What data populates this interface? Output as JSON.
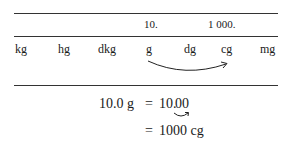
{
  "table": {
    "header_values": [
      {
        "unit": "g",
        "value": "10."
      },
      {
        "unit": "cg",
        "value": "1 000."
      }
    ],
    "units": [
      "kg",
      "hg",
      "dkg",
      "g",
      "dg",
      "cg",
      "mg"
    ],
    "arrow": {
      "from": "g",
      "to": "cg"
    }
  },
  "equation": {
    "line1_left": "10.0 g",
    "line1_eq": "=",
    "line1_right_int": "10.",
    "line1_right_dec": "00",
    "line2_eq": "=",
    "line2_right": "1000 cg"
  }
}
